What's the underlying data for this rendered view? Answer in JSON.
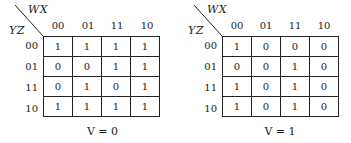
{
  "maps": [
    {
      "row_var": "YZ",
      "col_var": "WX",
      "col_headers": [
        "00",
        "01",
        "11",
        "10"
      ],
      "row_headers": [
        "00",
        "01",
        "11",
        "10"
      ],
      "cells": [
        [
          "1",
          "1",
          "1",
          "1"
        ],
        [
          "0",
          "0",
          "1",
          "1"
        ],
        [
          "0",
          "1",
          "0",
          "1"
        ],
        [
          "1",
          "1",
          "1",
          "1"
        ]
      ],
      "caption": "V = 0"
    },
    {
      "row_var": "YZ",
      "col_var": "WX",
      "col_headers": [
        "00",
        "01",
        "11",
        "10"
      ],
      "row_headers": [
        "00",
        "01",
        "11",
        "10"
      ],
      "cells": [
        [
          "1",
          "0",
          "0",
          "0"
        ],
        [
          "0",
          "0",
          "1",
          "0"
        ],
        [
          "1",
          "0",
          "1",
          "0"
        ],
        [
          "1",
          "0",
          "1",
          "0"
        ]
      ],
      "caption": "V = 1"
    }
  ]
}
